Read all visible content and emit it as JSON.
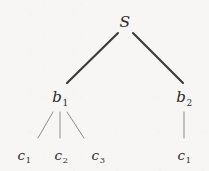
{
  "figure": {
    "kind": "parse-tree",
    "background_color": "#f7f6f4",
    "ink_color": "#2b2a29",
    "edge_color_upper": "#3a3a38",
    "edge_color_lower": "#8d8d8a",
    "width": 209,
    "height": 171
  },
  "nodes": {
    "root": {
      "id": "S",
      "base": "S",
      "sub": "",
      "x": 125,
      "y": 22,
      "level": 0
    },
    "internal": [
      {
        "id": "b1",
        "base": "b",
        "sub": "1",
        "x": 60,
        "y": 97,
        "level": 1
      },
      {
        "id": "b2",
        "base": "b",
        "sub": "2",
        "x": 184,
        "y": 97,
        "level": 1
      }
    ],
    "leaves": [
      {
        "id": "c1a",
        "base": "c",
        "sub": "1",
        "x": 24,
        "y": 155,
        "level": 2,
        "parent": "b1"
      },
      {
        "id": "c2",
        "base": "c",
        "sub": "2",
        "x": 61,
        "y": 155,
        "level": 2,
        "parent": "b1"
      },
      {
        "id": "c3",
        "base": "c",
        "sub": "3",
        "x": 98,
        "y": 155,
        "level": 2,
        "parent": "b1"
      },
      {
        "id": "c1b",
        "base": "c",
        "sub": "1",
        "x": 184,
        "y": 155,
        "level": 2,
        "parent": "b2"
      }
    ]
  },
  "edges": [
    {
      "id": "edge-s-b1",
      "from": "S",
      "to": "b1",
      "x1": 118,
      "y1": 33,
      "x2": 67,
      "y2": 83,
      "width": 2.1,
      "color": "#3a3a38"
    },
    {
      "id": "edge-s-b2",
      "from": "S",
      "to": "b2",
      "x1": 133,
      "y1": 33,
      "x2": 183,
      "y2": 83,
      "width": 2.1,
      "color": "#3a3a38"
    },
    {
      "id": "edge-b1-c1",
      "from": "b1",
      "to": "c1a",
      "x1": 53,
      "y1": 112,
      "x2": 38,
      "y2": 138,
      "width": 1.0,
      "color": "#8d8d8a"
    },
    {
      "id": "edge-b1-c2",
      "from": "b1",
      "to": "c2",
      "x1": 60,
      "y1": 112,
      "x2": 60,
      "y2": 138,
      "width": 1.0,
      "color": "#8d8d8a"
    },
    {
      "id": "edge-b1-c3",
      "from": "b1",
      "to": "c3",
      "x1": 67,
      "y1": 112,
      "x2": 84,
      "y2": 138,
      "width": 1.0,
      "color": "#8d8d8a"
    },
    {
      "id": "edge-b2-c1",
      "from": "b2",
      "to": "c1b",
      "x1": 184,
      "y1": 112,
      "x2": 184,
      "y2": 138,
      "width": 1.0,
      "color": "#8d8d8a"
    }
  ]
}
